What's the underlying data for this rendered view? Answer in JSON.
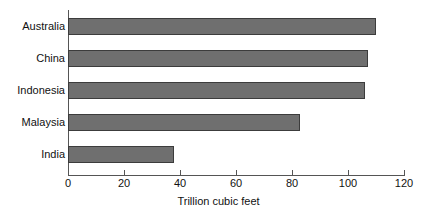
{
  "chart_data": {
    "type": "bar",
    "orientation": "horizontal",
    "title": "",
    "subtitle": "",
    "xlabel": "Trillion cubic feet",
    "ylabel": "",
    "categories": [
      "Australia",
      "China",
      "Indonesia",
      "Malaysia",
      "India"
    ],
    "values": [
      110,
      107,
      106,
      83,
      38
    ],
    "series": [
      {
        "name": "Reserves",
        "values": [
          110,
          107,
          106,
          83,
          38
        ]
      }
    ],
    "xlim": [
      0,
      120
    ],
    "xticks": [
      0,
      20,
      40,
      60,
      80,
      100,
      120
    ],
    "xtick_labels": [
      "0",
      "20",
      "40",
      "60",
      "80",
      "100",
      "120"
    ],
    "grid": false,
    "legend": false,
    "legend_position": "none",
    "colors": {
      "bar_fill": "#6f6f6f",
      "bar_border": "#3c3c3c",
      "axis": "#555555",
      "text": "#111111",
      "background": "#ffffff"
    }
  }
}
